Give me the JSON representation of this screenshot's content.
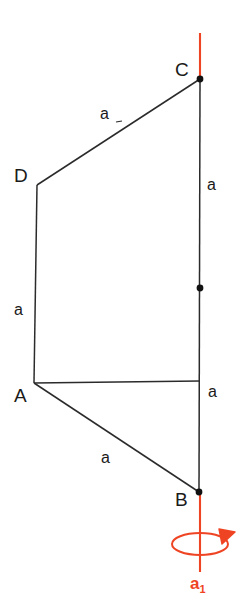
{
  "diagram": {
    "vertices": [
      {
        "id": "A",
        "label": "A",
        "x": 34,
        "y": 383
      },
      {
        "id": "B",
        "label": "B",
        "x": 199,
        "y": 492
      },
      {
        "id": "C",
        "label": "C",
        "x": 200,
        "y": 79
      },
      {
        "id": "D",
        "label": "D",
        "x": 37,
        "y": 185
      }
    ],
    "midpoint": {
      "label": "",
      "x": 200,
      "y": 288
    },
    "edges": [
      {
        "from": "D",
        "to": "C",
        "label": "a"
      },
      {
        "from": "C",
        "to": "B",
        "label": "a"
      },
      {
        "from": "D",
        "to": "A",
        "label": "a"
      },
      {
        "from": "A",
        "to": "B",
        "label": "a"
      },
      {
        "from": "A",
        "to": "axis",
        "label": "a"
      }
    ],
    "side_labels": {
      "dc": "a",
      "cb_upper": "a",
      "da": "a",
      "cb_lower": "a",
      "ab": "a"
    },
    "axis": {
      "label": "a",
      "subscript": "1",
      "color": "#ef4423",
      "top_y": 33,
      "bottom_y": 570,
      "x": 200,
      "rotation_arrow": "counterclockwise-ellipse"
    },
    "colors": {
      "line": "#2b2b2b",
      "vertex_dot": "#111111",
      "axis": "#ef4423",
      "background": "#ffffff"
    }
  }
}
